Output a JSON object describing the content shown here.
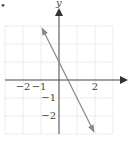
{
  "chart_data": {
    "type": "line",
    "title": "",
    "xlabel": "",
    "ylabel": "y",
    "xlim": [
      -3,
      3
    ],
    "ylim": [
      -3,
      3
    ],
    "grid": true,
    "x_tick_labels": [
      {
        "value": -2,
        "label": "−2"
      },
      {
        "value": -1,
        "label": "−1"
      },
      {
        "value": 2,
        "label": "2"
      }
    ],
    "y_tick_labels": [
      {
        "value": -1,
        "label": "−1"
      },
      {
        "value": -2,
        "label": "−2"
      }
    ],
    "series": [
      {
        "name": "line",
        "equation": "y = -2x + 1",
        "x": [
          -1,
          2
        ],
        "y": [
          3,
          -3
        ],
        "arrows_both_ends": true
      }
    ],
    "colors": {
      "line": "#8a8a8a",
      "axes": "#555555",
      "grid": "#d8d8d8"
    }
  },
  "marker": "•"
}
